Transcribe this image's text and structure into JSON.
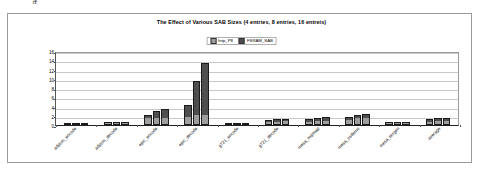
{
  "chart_data": {
    "type": "bar",
    "title": "The Effect of Various SAB Sizes (4 entries, 8 entries, 16 entreis)",
    "xlabel": "",
    "ylabel": "Relative Speedup (%)",
    "ylim": [
      0,
      16
    ],
    "yticks": [
      0,
      2,
      4,
      6,
      8,
      10,
      12,
      14,
      16
    ],
    "grid": true,
    "legend_position": "top-center",
    "legend": [
      "Intp_P8",
      "FSRAM_SAB"
    ],
    "colors": {
      "intp_p8": "#9e9e9e",
      "fsram_sab": "#4f4f4f"
    },
    "categories": [
      "adpcm_encode",
      "adpcm_decode",
      "epic_encode",
      "epic_decode",
      "g721_encode",
      "g721_decode",
      "mesa_mipmap",
      "mesa_osdemo",
      "mesa_texgen",
      "average"
    ],
    "series": [
      {
        "name": "Intp_P8",
        "values_by_group": [
          [
            0.3,
            0.3,
            0.3
          ],
          [
            0.5,
            0.6,
            0.6
          ],
          [
            1.6,
            1.6,
            1.6
          ],
          [
            1.6,
            2.0,
            2.1
          ],
          [
            0.0,
            0.0,
            0.0
          ],
          [
            0.6,
            0.8,
            0.8
          ],
          [
            0.7,
            0.9,
            1.0
          ],
          [
            1.2,
            1.5,
            1.5
          ],
          [
            0.4,
            0.5,
            0.5
          ],
          [
            0.7,
            0.9,
            0.9
          ]
        ]
      },
      {
        "name": "FSRAM_SAB",
        "values_by_group": [
          [
            0.3,
            0.3,
            0.4
          ],
          [
            0.6,
            0.7,
            0.7
          ],
          [
            2.2,
            3.0,
            3.4
          ],
          [
            4.4,
            9.6,
            13.4
          ],
          [
            0.0,
            0.0,
            0.0
          ],
          [
            1.0,
            1.3,
            1.4
          ],
          [
            1.3,
            1.6,
            1.7
          ],
          [
            1.8,
            2.2,
            2.3
          ],
          [
            0.6,
            0.7,
            0.7
          ],
          [
            1.2,
            1.5,
            1.6
          ]
        ]
      }
    ]
  }
}
